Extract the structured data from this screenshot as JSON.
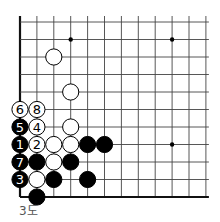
{
  "diagram": {
    "caption": "3도",
    "grid": {
      "columns": 12,
      "rows": 11,
      "origin_x": 20,
      "origin_y": 22,
      "spacing_x": 16.9,
      "spacing_y": 17.5,
      "extend_top": 6,
      "extend_right": 3,
      "left_edge": true,
      "bottom_edge": true,
      "top_edge": false,
      "right_edge": false,
      "line_color": "#444444",
      "edge_color": "#111111"
    },
    "star_points": [
      {
        "col": 3,
        "row": 1
      },
      {
        "col": 9,
        "row": 1
      },
      {
        "col": 9,
        "row": 7
      }
    ],
    "stones": [
      {
        "col": 2,
        "row": 2,
        "color": "white",
        "label": ""
      },
      {
        "col": 3,
        "row": 4,
        "color": "white",
        "label": ""
      },
      {
        "col": 0,
        "row": 5,
        "color": "white",
        "label": "6"
      },
      {
        "col": 1,
        "row": 5,
        "color": "white",
        "label": "8"
      },
      {
        "col": 0,
        "row": 6,
        "color": "black",
        "label": "5"
      },
      {
        "col": 1,
        "row": 6,
        "color": "white",
        "label": "4"
      },
      {
        "col": 3,
        "row": 6,
        "color": "white",
        "label": ""
      },
      {
        "col": 0,
        "row": 7,
        "color": "black",
        "label": "1"
      },
      {
        "col": 1,
        "row": 7,
        "color": "white",
        "label": "2"
      },
      {
        "col": 2,
        "row": 7,
        "color": "white",
        "label": ""
      },
      {
        "col": 3,
        "row": 7,
        "color": "white",
        "label": ""
      },
      {
        "col": 4,
        "row": 7,
        "color": "black",
        "label": ""
      },
      {
        "col": 5,
        "row": 7,
        "color": "black",
        "label": ""
      },
      {
        "col": 0,
        "row": 8,
        "color": "black",
        "label": "7"
      },
      {
        "col": 1,
        "row": 8,
        "color": "black",
        "label": ""
      },
      {
        "col": 2,
        "row": 8,
        "color": "white",
        "label": ""
      },
      {
        "col": 3,
        "row": 8,
        "color": "black",
        "label": ""
      },
      {
        "col": 0,
        "row": 9,
        "color": "black",
        "label": "3"
      },
      {
        "col": 1,
        "row": 9,
        "color": "white",
        "label": ""
      },
      {
        "col": 2,
        "row": 9,
        "color": "black",
        "label": ""
      },
      {
        "col": 4,
        "row": 9,
        "color": "black",
        "label": ""
      },
      {
        "col": 1,
        "row": 10,
        "color": "black",
        "label": ""
      }
    ],
    "colors": {
      "black_stone": "#000000",
      "white_stone": "#ffffff",
      "stone_outline": "#000000"
    }
  }
}
